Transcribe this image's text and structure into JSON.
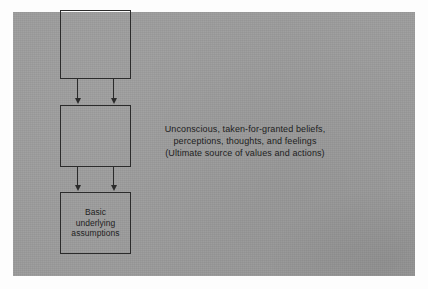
{
  "figure": {
    "kind": "block-diagram",
    "panel_color": "#9b9b9b",
    "page_color": "#fdfdfd",
    "line_color": "#2b2b2b",
    "text_color": "#1d1d1d"
  },
  "boxes": [
    {
      "name": "artifacts-box",
      "label": ""
    },
    {
      "name": "values-box",
      "label": ""
    },
    {
      "name": "assumptions-box",
      "label_lines": [
        "Basic",
        "underlying",
        "assumptions"
      ]
    }
  ],
  "connectors": [
    {
      "name": "arrow-upper-left",
      "direction": "down"
    },
    {
      "name": "arrow-upper-right",
      "direction": "down"
    },
    {
      "name": "arrow-lower-left",
      "direction": "down"
    },
    {
      "name": "arrow-lower-right",
      "direction": "down"
    }
  ],
  "caption": {
    "lines": [
      "Unconscious, taken-for-granted beliefs,",
      "perceptions, thoughts, and feelings",
      "(Ultimate source of values and actions)"
    ]
  }
}
